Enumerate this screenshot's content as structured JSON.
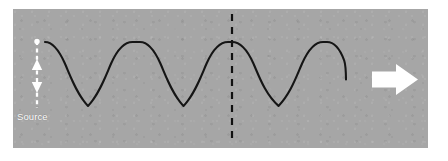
{
  "figure": {
    "panel": {
      "background_color": "#a6a6a6",
      "border_color": "#ffffff",
      "x": 13,
      "y": 9,
      "width": 415,
      "height": 139
    },
    "source": {
      "label": "Source",
      "label_color": "#ffffff",
      "oscillation_arrow": {
        "name": "double-headed vertical dashed arrow",
        "color": "#ffffff",
        "style": "dashed",
        "direction": "up-down",
        "x": 37,
        "y_top": 41,
        "y_bottom": 108
      },
      "origin_dot_color": "#ffffff"
    },
    "wave": {
      "color": "#151515",
      "stroke_width": 2.1,
      "amplitude_px": 32,
      "wavelength_px": 95,
      "start_x": 45,
      "end_x": 346,
      "midline_y": 74,
      "crest_y": 42,
      "trough_y": 106,
      "crests_x": [
        45,
        140,
        232,
        327
      ],
      "troughs_x": [
        88,
        184,
        279
      ],
      "cycles": 3.2
    },
    "reference_line": {
      "name": "dashed vertical reference line",
      "color": "#111111",
      "style": "dashed",
      "x": 232,
      "y_top": 14,
      "y_bottom": 144,
      "dash": "7 6"
    },
    "direction_arrow": {
      "name": "wave propagation arrow",
      "color": "#ffffff",
      "direction": "right",
      "x": 372,
      "y": 79,
      "length": 46,
      "head_width": 30
    }
  }
}
